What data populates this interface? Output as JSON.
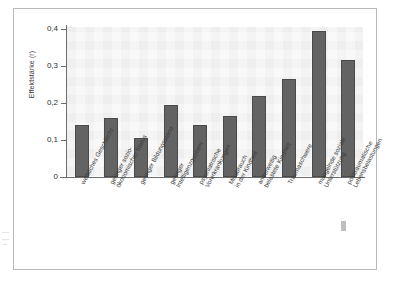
{
  "figure": {
    "axis_title_y": "Effektstärke (r)",
    "bar_color": "#636363",
    "bar_edge_color": "#4a4a4a",
    "plot_background": "#f4f4f4",
    "frame_color": "#b9b9b9"
  },
  "chart_data": {
    "type": "bar",
    "title": "",
    "xlabel": "",
    "ylabel": "Effektstärke (r)",
    "ylim": [
      0,
      0.4
    ],
    "yticks": [
      0,
      0.1,
      0.2,
      0.3,
      0.4
    ],
    "ytick_labels": [
      "0",
      "0,1",
      "0,2",
      "0,3",
      "0,4"
    ],
    "grid": false,
    "legend": "none",
    "decimal_separator": ",",
    "categories": [
      "weibliches Geschlecht",
      "geringer sozio-ökonomischer Status",
      "geringer Bildungsstand",
      "geringer Intelligenzquotient",
      "psychiatrische Vorerkrankungen",
      "Missbrauch in der Kindheit",
      "anderweitig belastete Kindheit",
      "Traumaschwere",
      "mangelnde soziale Unterstützung",
      "posttraumatische Lebensbelastungen"
    ],
    "category_lines": [
      [
        "weibliches Geschlecht"
      ],
      [
        "geringer sozio-",
        "ökonomischer Status"
      ],
      [
        "geringer Bildungsstand"
      ],
      [
        "geringer",
        "Intelligenzquotient"
      ],
      [
        "psychiatrische",
        "Vorerkrankungen"
      ],
      [
        "Missbrauch",
        "in der Kindheit"
      ],
      [
        "anderweitig",
        "belastete Kindheit"
      ],
      [
        "Traumaschwere"
      ],
      [
        "mangelnde soziale",
        "Unterstützung"
      ],
      [
        "posttraumatische",
        "Lebensbelastungen"
      ]
    ],
    "values": [
      0.14,
      0.16,
      0.105,
      0.195,
      0.14,
      0.165,
      0.22,
      0.265,
      0.395,
      0.315
    ]
  }
}
